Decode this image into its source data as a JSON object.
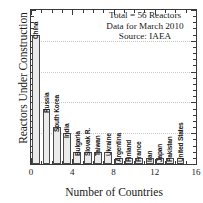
{
  "chart_data": {
    "type": "bar",
    "title": "",
    "xlabel": "Number of Countries",
    "ylabel": "Reactors Under Construction",
    "xlim": [
      0,
      16
    ],
    "ylim": [
      0,
      25
    ],
    "grid": true,
    "legend": "none",
    "xticks": [
      "0",
      "4",
      "8",
      "12",
      "16"
    ],
    "yticks": [
      "0",
      "5",
      "10",
      "15",
      "20",
      "25"
    ],
    "categories": [
      "China",
      "Russia",
      "South Korea",
      "India",
      "Bulgaria",
      "Slovak R.",
      "Taiwan",
      "Ukraine",
      "Argentina",
      "Finland",
      "France",
      "Iran",
      "Japan",
      "Pakistan",
      "United States"
    ],
    "values": [
      21,
      9,
      6,
      5,
      2,
      2,
      2,
      2,
      1,
      1,
      1,
      1,
      1,
      1,
      1
    ],
    "annotations": [
      "Total = 56 Reactors",
      "Data for March 2010",
      "Source: IAEA"
    ]
  },
  "figure": {
    "bar_fill_color": "#ebebeb",
    "bar_edge_color": "#4a4a4a",
    "axis_color": "#3a3a3a",
    "grid_color": "#c9c9c9",
    "background_color": "#ffffff"
  }
}
